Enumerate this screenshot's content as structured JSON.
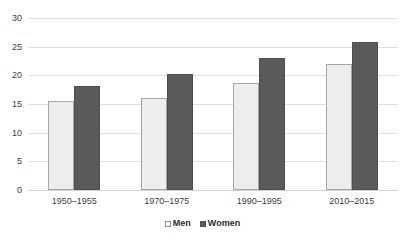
{
  "chart_data": {
    "type": "bar",
    "title": "",
    "subtitle": "",
    "xlabel": "",
    "ylabel": "",
    "categories": [
      "1950–1955",
      "1970–1975",
      "1990–1995",
      "2010–2015"
    ],
    "series": [
      {
        "name": "Men",
        "values": [
          15.5,
          16.1,
          18.7,
          22.0
        ],
        "color": "#ededed"
      },
      {
        "name": "Women",
        "values": [
          18.1,
          20.2,
          23.0,
          25.9
        ],
        "color": "#5a5a5a"
      }
    ],
    "ylim": [
      0,
      30
    ],
    "ytick_step": 5,
    "yticks": [
      0,
      5,
      10,
      15,
      20,
      25,
      30
    ],
    "ytick_labels": [
      "0",
      "5",
      "10",
      "15",
      "20",
      "25",
      "30"
    ],
    "grid": true,
    "grid_axis": "y",
    "legend_position": "bottom-center",
    "annotations": []
  },
  "legend": {
    "entries": [
      {
        "label": "Men",
        "swatch": "legend-swatch-men"
      },
      {
        "label": "Women",
        "swatch": "legend-swatch-women"
      }
    ]
  },
  "colors": {
    "men_fill": "#ededed",
    "men_border": "#a6a6a6",
    "women_fill": "#5a5a5a",
    "women_border": "#4e4e4e",
    "gridline": "#e0e0e0",
    "baseline": "#d2d2d2",
    "text": "#3b3b3b",
    "background": "#ffffff"
  }
}
